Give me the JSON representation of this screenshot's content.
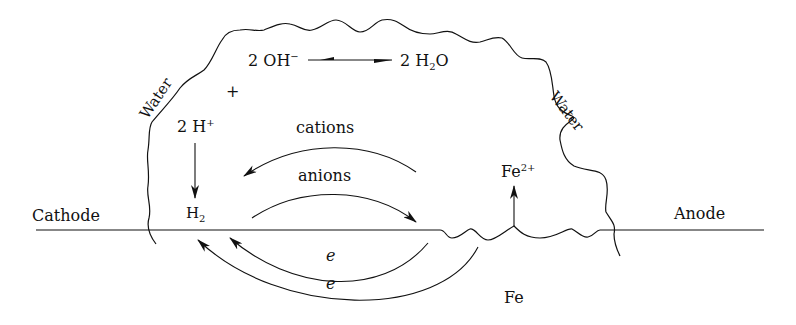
{
  "diagram": {
    "labels": {
      "cathode": "Cathode",
      "anode": "Anode",
      "metal": "Fe",
      "water_left": "Water",
      "water_right": "Water",
      "hydroxide": {
        "coef": "2",
        "species": "OH",
        "charge": "−"
      },
      "water_product": {
        "coef": "2",
        "species_a": "H",
        "sub": "2",
        "species_b": "O"
      },
      "protons": {
        "coef": "2",
        "species": "H",
        "charge": "+"
      },
      "hydrogen": {
        "species": "H",
        "sub": "2"
      },
      "iron_ion": {
        "species": "Fe",
        "charge": "2+"
      },
      "plus_sign": "+",
      "cations": "cations",
      "anions": "anions",
      "electron_1": "e",
      "electron_2": "e"
    },
    "arrows": [
      {
        "from": "2 OH−",
        "to": "2 H2O",
        "type": "equilibrium"
      },
      {
        "from": "2 H+",
        "to": "H2",
        "direction": "down"
      },
      {
        "label": "cations",
        "direction": "anode-to-cathode"
      },
      {
        "label": "anions",
        "direction": "cathode-to-anode"
      },
      {
        "label": "e",
        "direction": "anode-to-cathode",
        "path": "through metal"
      },
      {
        "label": "e",
        "direction": "anode-to-cathode",
        "path": "through metal"
      },
      {
        "from": "Fe surface",
        "to": "Fe2+",
        "direction": "up"
      }
    ]
  }
}
